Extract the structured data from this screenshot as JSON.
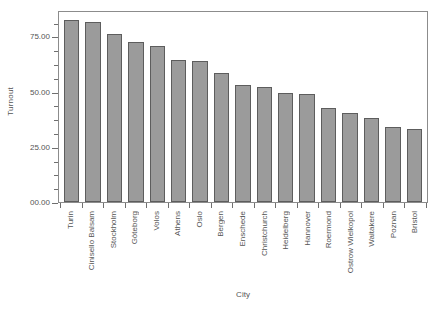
{
  "chart_data": {
    "type": "bar",
    "title": "",
    "xlabel": "City",
    "ylabel": "Turnout",
    "ylim": [
      0,
      87
    ],
    "yticks": [
      0,
      25,
      50,
      75
    ],
    "ytick_labels": [
      "00.00",
      "25.00",
      "50.00",
      "75.00"
    ],
    "grid": false,
    "legend": null,
    "categories": [
      "Turin",
      "Cinisello Balsam",
      "Stockholm",
      "Göteborg",
      "Volos",
      "Athens",
      "Oslo",
      "Bergen",
      "Enschede",
      "Christchurch",
      "Heidelberg",
      "Hannover",
      "Roermond",
      "Ostrow Wielkopol",
      "Waitakere",
      "Poznan",
      "Bristol"
    ],
    "values": [
      82.5,
      81.5,
      76.0,
      72.5,
      70.5,
      64.5,
      64.0,
      58.5,
      53.0,
      52.0,
      49.5,
      49.0,
      42.5,
      40.5,
      38.0,
      34.0,
      33.0
    ],
    "bar_color": "#9b9b9b",
    "bar_edge_color": "#5d5d5d",
    "axis_color": "#8c8c8c"
  }
}
